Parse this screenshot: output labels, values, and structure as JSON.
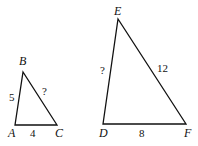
{
  "triangles": [
    {
      "name": "ABC",
      "vertices": {
        "A": "A",
        "B": "B",
        "C": "C"
      },
      "sides": {
        "AB": "5",
        "AC": "4",
        "BC": "?"
      }
    },
    {
      "name": "DEF",
      "vertices": {
        "D": "D",
        "E": "E",
        "F": "F"
      },
      "sides": {
        "DE": "?",
        "EF": "12",
        "DF": "8"
      }
    }
  ],
  "colors": {
    "stroke": "#111111",
    "background": "#ffffff"
  }
}
